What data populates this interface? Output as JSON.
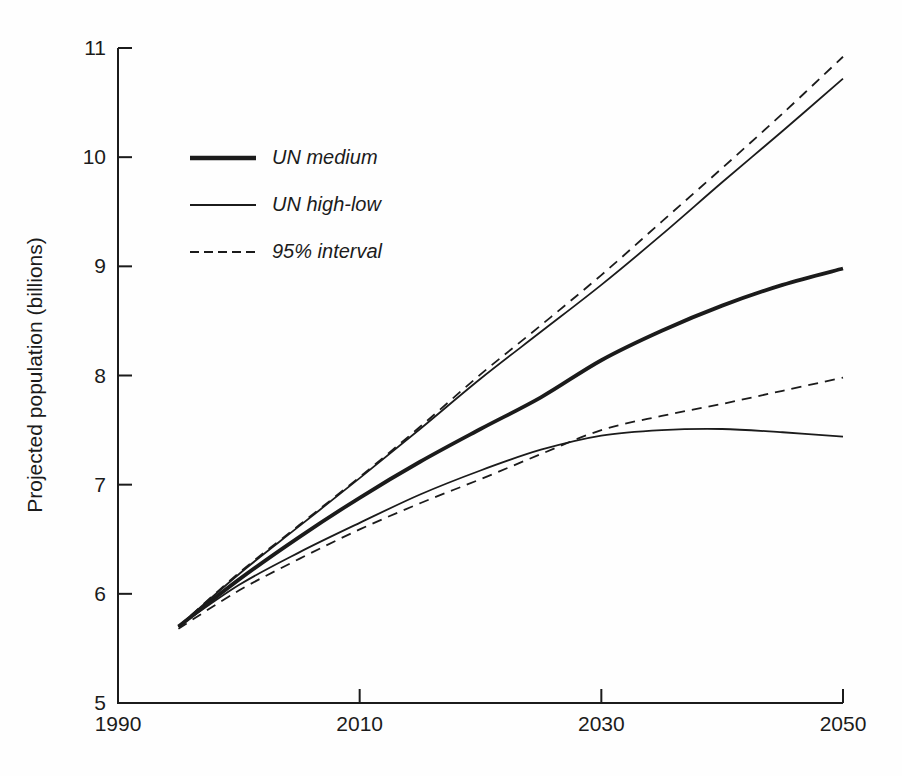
{
  "figure": {
    "background": "#fefefe",
    "ink_color": "#1b1b1b",
    "ylabel": "Projected population (billions)"
  },
  "legend": {
    "items": [
      {
        "label": "UN medium",
        "style": "thick-solid"
      },
      {
        "label": "UN high-low",
        "style": "thin-solid"
      },
      {
        "label": "95% interval",
        "style": "dashed"
      }
    ]
  },
  "chart_data": {
    "type": "line",
    "title": "",
    "xlabel": "",
    "ylabel": "Projected population (billions)",
    "xlim": [
      1990,
      2050
    ],
    "ylim": [
      5,
      11
    ],
    "x_ticks": [
      1990,
      2010,
      2030,
      2050
    ],
    "y_ticks": [
      5,
      6,
      7,
      8,
      9,
      10,
      11
    ],
    "grid": false,
    "legend_position": "upper-left-inside",
    "x": [
      1995,
      2000,
      2005,
      2010,
      2015,
      2020,
      2025,
      2030,
      2035,
      2040,
      2045,
      2050
    ],
    "series": [
      {
        "name": "UN medium",
        "line": "thick-solid",
        "values": [
          5.7,
          6.13,
          6.52,
          6.88,
          7.21,
          7.51,
          7.8,
          8.14,
          8.41,
          8.64,
          8.83,
          8.98
        ]
      },
      {
        "name": "UN high",
        "line": "thin-solid",
        "values": [
          5.7,
          6.18,
          6.62,
          7.06,
          7.51,
          7.97,
          8.4,
          8.83,
          9.29,
          9.77,
          10.24,
          10.72
        ]
      },
      {
        "name": "UN low",
        "line": "thin-solid",
        "values": [
          5.7,
          6.08,
          6.38,
          6.65,
          6.91,
          7.13,
          7.32,
          7.45,
          7.5,
          7.51,
          7.48,
          7.44
        ]
      },
      {
        "name": "95 percent upper",
        "line": "dashed",
        "values": [
          5.7,
          6.19,
          6.63,
          7.07,
          7.53,
          8.01,
          8.46,
          8.92,
          9.41,
          9.9,
          10.4,
          10.92
        ]
      },
      {
        "name": "95 percent lower",
        "line": "dashed",
        "values": [
          5.68,
          6.03,
          6.32,
          6.59,
          6.83,
          7.05,
          7.28,
          7.5,
          7.63,
          7.74,
          7.86,
          7.98
        ]
      }
    ]
  }
}
